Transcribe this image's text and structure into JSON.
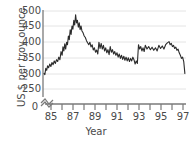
{
  "chart_data": {
    "type": "line",
    "title": "",
    "xlabel": "Year",
    "ylabel": "US $ per troy ounce",
    "xlim": [
      1985.0,
      1997.6
    ],
    "ylim": [
      240,
      510
    ],
    "yticks": [
      250,
      300,
      350,
      400,
      450,
      500
    ],
    "y_axis_break": true,
    "y_axis_origin_label": "0",
    "xticks_major": [
      85,
      87,
      89,
      91,
      93,
      95,
      97
    ],
    "xticks_minor": [
      86,
      88,
      90,
      92,
      94,
      96
    ],
    "grid": "horizontal",
    "legend": "none",
    "series": [
      {
        "name": "Gold price",
        "color": "#2b2b2b",
        "x": [
          1985.05,
          1985.12,
          1985.2,
          1985.28,
          1985.36,
          1985.45,
          1985.55,
          1985.65,
          1985.75,
          1985.85,
          1985.95,
          1986.05,
          1986.15,
          1986.25,
          1986.35,
          1986.45,
          1986.55,
          1986.65,
          1986.72,
          1986.8,
          1986.88,
          1986.96,
          1987.04,
          1987.12,
          1987.2,
          1987.28,
          1987.36,
          1987.44,
          1987.52,
          1987.6,
          1987.68,
          1987.76,
          1987.84,
          1987.92,
          1988.0,
          1988.08,
          1988.16,
          1988.24,
          1988.32,
          1988.4,
          1988.5,
          1988.6,
          1988.7,
          1988.8,
          1988.9,
          1989.0,
          1989.1,
          1989.2,
          1989.3,
          1989.4,
          1989.5,
          1989.6,
          1989.7,
          1989.8,
          1989.9,
          1990.0,
          1990.1,
          1990.2,
          1990.3,
          1990.4,
          1990.5,
          1990.6,
          1990.7,
          1990.8,
          1990.9,
          1991.0,
          1991.1,
          1991.2,
          1991.3,
          1991.4,
          1991.5,
          1991.6,
          1991.7,
          1991.8,
          1991.9,
          1992.0,
          1992.1,
          1992.2,
          1992.3,
          1992.4,
          1992.5,
          1992.6,
          1992.7,
          1992.8,
          1992.9,
          1993.0,
          1993.1,
          1993.2,
          1993.3,
          1993.4,
          1993.5,
          1993.6,
          1993.7,
          1993.8,
          1993.9,
          1994.0,
          1994.15,
          1994.3,
          1994.45,
          1994.6,
          1994.75,
          1994.9,
          1995.05,
          1995.2,
          1995.35,
          1995.5,
          1995.65,
          1995.8,
          1995.95,
          1996.1,
          1996.2,
          1996.3,
          1996.4,
          1996.5,
          1996.6,
          1996.7,
          1996.8,
          1996.9,
          1997.0,
          1997.1,
          1997.2,
          1997.3,
          1997.4,
          1997.5
        ],
        "y": [
          300,
          296,
          316,
          310,
          324,
          318,
          330,
          322,
          335,
          328,
          340,
          332,
          344,
          338,
          352,
          344,
          370,
          358,
          385,
          372,
          395,
          378,
          400,
          392,
          420,
          408,
          440,
          425,
          452,
          442,
          470,
          455,
          488,
          462,
          470,
          448,
          462,
          440,
          452,
          436,
          430,
          420,
          415,
          405,
          398,
          392,
          400,
          385,
          392,
          375,
          382,
          368,
          375,
          362,
          400,
          380,
          396,
          378,
          390,
          372,
          382,
          366,
          376,
          360,
          386,
          368,
          376,
          362,
          370,
          358,
          366,
          352,
          362,
          348,
          358,
          345,
          355,
          342,
          352,
          340,
          350,
          338,
          348,
          340,
          352,
          344,
          330,
          340,
          332,
          392,
          378,
          386,
          372,
          382,
          370,
          390,
          378,
          386,
          376,
          384,
          374,
          382,
          372,
          390,
          380,
          388,
          378,
          392,
          398,
          402,
          392,
          396,
          386,
          390,
          380,
          384,
          374,
          378,
          366,
          358,
          348,
          352,
          338,
          300
        ]
      }
    ]
  },
  "axis": {
    "ytick_labels": [
      "500",
      "450",
      "400",
      "350",
      "300",
      "250"
    ],
    "origin_label": "0",
    "xtick_labels": [
      "85",
      "87",
      "89",
      "91",
      "93",
      "95",
      "97"
    ],
    "xaxis_title": "Year",
    "yaxis_title": "US $ per troy ounce"
  },
  "colors": {
    "line": "#2b2b2b",
    "grid": "#e2e2e2",
    "axis": "#6e6e6e",
    "text": "#4a4a4a"
  }
}
